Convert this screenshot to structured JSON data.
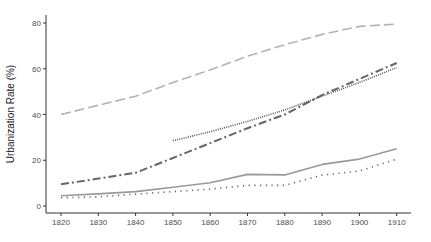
{
  "chart_data": {
    "type": "line",
    "title": "",
    "xlabel": "",
    "ylabel": "Urbanization Rate (%)",
    "xlim": [
      1816,
      1914
    ],
    "ylim": [
      -3,
      84
    ],
    "grid": false,
    "legend": null,
    "x_ticks": [
      1820,
      1830,
      1840,
      1850,
      1860,
      1870,
      1880,
      1890,
      1900,
      1910
    ],
    "x_tick_labels": [
      "1820",
      "1830",
      "1840",
      "1850",
      "1860",
      "1870",
      "1880",
      "1890",
      "1900",
      "1910"
    ],
    "y_ticks": [
      0,
      20,
      40,
      60,
      80
    ],
    "y_tick_labels": [
      "0",
      "20",
      "40",
      "60",
      "80"
    ],
    "series": [
      {
        "name": "series-longdash",
        "style": "longdash",
        "color": "#b3b3b3",
        "x": [
          1820,
          1830,
          1840,
          1850,
          1860,
          1870,
          1880,
          1890,
          1900,
          1910
        ],
        "values": [
          40,
          44,
          48,
          54,
          59.5,
          65.5,
          70.5,
          75,
          78.5,
          79.5
        ]
      },
      {
        "name": "series-dashdot",
        "style": "dashdot",
        "color": "#666666",
        "x": [
          1820,
          1830,
          1840,
          1850,
          1860,
          1870,
          1880,
          1890,
          1900,
          1910
        ],
        "values": [
          9.5,
          12,
          14.5,
          21,
          27.5,
          34,
          40,
          48.5,
          55.5,
          62.5
        ]
      },
      {
        "name": "series-finedot",
        "style": "finedot",
        "color": "#555555",
        "x": [
          1850,
          1860,
          1870,
          1880,
          1890,
          1900,
          1910
        ],
        "values": [
          28.5,
          32.5,
          37,
          42,
          48,
          54,
          60.5
        ]
      },
      {
        "name": "series-solid",
        "style": "solid",
        "color": "#999999",
        "x": [
          1820,
          1830,
          1840,
          1850,
          1860,
          1870,
          1880,
          1890,
          1900,
          1910
        ],
        "values": [
          4.5,
          5.3,
          6.3,
          8.2,
          10.2,
          13.8,
          13.6,
          18.2,
          20.5,
          25
        ]
      },
      {
        "name": "series-sparsedot",
        "style": "sparsedot",
        "color": "#666666",
        "x": [
          1820,
          1830,
          1840,
          1850,
          1860,
          1870,
          1880,
          1890,
          1900,
          1910
        ],
        "values": [
          3.6,
          4,
          5.2,
          6.3,
          7.4,
          9,
          9,
          13.5,
          15.3,
          20.5
        ]
      }
    ]
  }
}
